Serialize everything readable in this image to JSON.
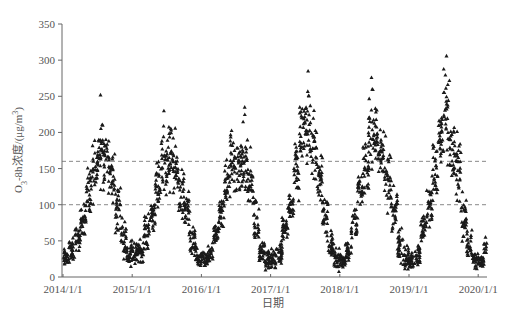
{
  "chart_data": {
    "type": "scatter",
    "title": "",
    "xlabel": "日期",
    "ylabel": "O3-8h浓度/(μg/m³)",
    "ylabel_parts": {
      "main": "O",
      "sub": "3",
      "rest": "-8h浓度/(μg/m",
      "sup": "3",
      "end": ")"
    },
    "ylim": [
      0,
      350
    ],
    "yticks": [
      0,
      50,
      100,
      150,
      200,
      250,
      300,
      350
    ],
    "xlim": [
      "2014/1/1",
      "2020/4/30"
    ],
    "xticks": [
      "2014/1/1",
      "2015/1/1",
      "2016/1/1",
      "2017/1/1",
      "2018/1/1",
      "2019/1/1",
      "2020/1/1"
    ],
    "grid": false,
    "legend": null,
    "reference_lines": [
      {
        "y": 160,
        "style": "dashed",
        "color": "#888888"
      },
      {
        "y": 100,
        "style": "dashed",
        "color": "#888888"
      }
    ],
    "marker": {
      "shape": "triangle",
      "color": "#1a1a1a",
      "size": 2
    },
    "series": [
      {
        "name": "O3-8h daily",
        "description": "Daily maximum 8-hour O3 concentration; strong seasonal cycle with summer peaks and winter troughs",
        "monthly_ranges": [
          {
            "year": 2014,
            "months": [
              [
                8,
                45
              ],
              [
                15,
                60
              ],
              [
                30,
                75
              ],
              [
                50,
                110
              ],
              [
                70,
                170
              ],
              [
                90,
                200
              ],
              [
                110,
                250
              ],
              [
                100,
                230
              ],
              [
                80,
                190
              ],
              [
                40,
                150
              ],
              [
                20,
                90
              ],
              [
                10,
                60
              ]
            ]
          },
          {
            "year": 2015,
            "months": [
              [
                10,
                55
              ],
              [
                15,
                60
              ],
              [
                30,
                95
              ],
              [
                55,
                120
              ],
              [
                75,
                170
              ],
              [
                95,
                230
              ],
              [
                100,
                225
              ],
              [
                85,
                215
              ],
              [
                60,
                170
              ],
              [
                35,
                130
              ],
              [
                15,
                80
              ],
              [
                5,
                45
              ]
            ]
          },
          {
            "year": 2016,
            "months": [
              [
                5,
                40
              ],
              [
                10,
                55
              ],
              [
                40,
                80
              ],
              [
                55,
                120
              ],
              [
                80,
                180
              ],
              [
                100,
                220
              ],
              [
                95,
                210
              ],
              [
                80,
                235
              ],
              [
                60,
                190
              ],
              [
                30,
                130
              ],
              [
                15,
                60
              ],
              [
                5,
                40
              ]
            ]
          },
          {
            "year": 2017,
            "months": [
              [
                5,
                45
              ],
              [
                10,
                60
              ],
              [
                40,
                100
              ],
              [
                70,
                130
              ],
              [
                90,
                200
              ],
              [
                120,
                280
              ],
              [
                130,
                285
              ],
              [
                100,
                250
              ],
              [
                80,
                200
              ],
              [
                40,
                130
              ],
              [
                15,
                70
              ],
              [
                5,
                45
              ]
            ]
          },
          {
            "year": 2018,
            "months": [
              [
                5,
                40
              ],
              [
                15,
                60
              ],
              [
                40,
                110
              ],
              [
                70,
                160
              ],
              [
                100,
                210
              ],
              [
                130,
                275
              ],
              [
                120,
                250
              ],
              [
                90,
                230
              ],
              [
                70,
                200
              ],
              [
                40,
                140
              ],
              [
                15,
                80
              ],
              [
                5,
                50
              ]
            ]
          },
          {
            "year": 2019,
            "months": [
              [
                5,
                40
              ],
              [
                10,
                55
              ],
              [
                35,
                100
              ],
              [
                60,
                140
              ],
              [
                90,
                200
              ],
              [
                120,
                265
              ],
              [
                130,
                305
              ],
              [
                100,
                240
              ],
              [
                80,
                210
              ],
              [
                40,
                130
              ],
              [
                15,
                70
              ],
              [
                5,
                40
              ]
            ]
          },
          {
            "year": 2020,
            "months": [
              [
                5,
                40
              ],
              [
                10,
                70
              ],
              [
                30,
                100
              ],
              [
                40,
                125
              ]
            ]
          }
        ],
        "peaks": [
          {
            "date": "2014/7",
            "value": 252
          },
          {
            "date": "2015/6",
            "value": 230
          },
          {
            "date": "2016/8",
            "value": 235
          },
          {
            "date": "2017/7",
            "value": 285
          },
          {
            "date": "2018/6",
            "value": 276
          },
          {
            "date": "2019/7",
            "value": 306
          }
        ],
        "points_per_month": 28
      }
    ]
  }
}
